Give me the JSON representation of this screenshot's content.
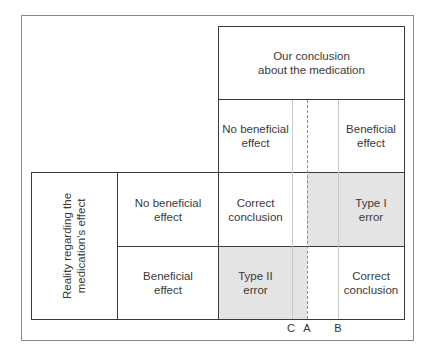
{
  "diagram": {
    "header": {
      "title_line1": "Our conclusion",
      "title_line2": "about the medication"
    },
    "columns": [
      {
        "line1": "No beneficial",
        "line2": "effect"
      },
      {
        "line1": "Beneficial",
        "line2": "effect"
      }
    ],
    "row_group": {
      "line1": "Reality regarding the",
      "line2": "medication's effect"
    },
    "rows": [
      {
        "line1": "No beneficial",
        "line2": "effect",
        "cells": [
          {
            "line1": "Correct",
            "line2": "conclusion"
          },
          {
            "line1": "Type I",
            "line2": "error"
          }
        ]
      },
      {
        "line1": "Beneficial",
        "line2": "effect",
        "cells": [
          {
            "line1": "Type II",
            "line2": "error"
          },
          {
            "line1": "Correct",
            "line2": "conclusion"
          }
        ]
      }
    ],
    "threshold_markers": [
      {
        "label": "C"
      },
      {
        "label": "A"
      },
      {
        "label": "B"
      }
    ],
    "colors": {
      "shade": "#e4e4e4",
      "line": "#3a3a3a"
    }
  }
}
